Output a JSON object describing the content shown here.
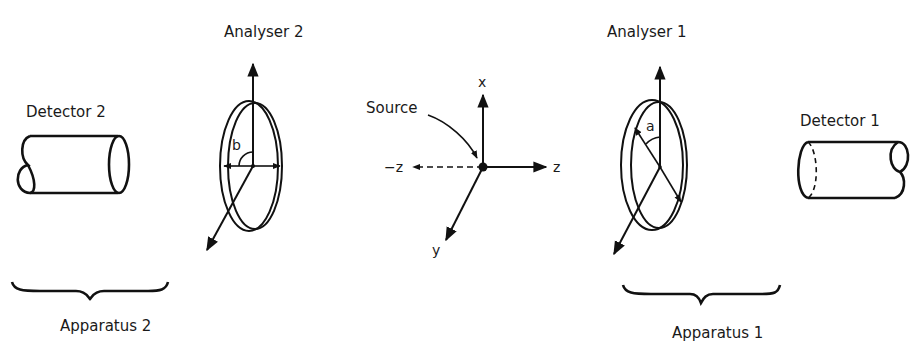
{
  "diagram": {
    "type": "EPR polarization correlation experiment schematic",
    "labels": {
      "analyser2": "Analyser 2",
      "analyser1": "Analyser 1",
      "detector2": "Detector 2",
      "detector1": "Detector 1",
      "source": "Source",
      "axis_x": "x",
      "axis_y": "y",
      "axis_z": "z",
      "axis_neg_z": "−z",
      "angle_b": "b",
      "angle_a": "a",
      "apparatus2": "Apparatus 2",
      "apparatus1": "Apparatus 1"
    },
    "groups": [
      {
        "name": "Apparatus 2",
        "contains": [
          "Detector 2",
          "Analyser 2"
        ],
        "angle": "b",
        "side": "left"
      },
      {
        "name": "Apparatus 1",
        "contains": [
          "Analyser 1",
          "Detector 1"
        ],
        "angle": "a",
        "side": "right"
      }
    ],
    "coordinate_axes": [
      "x",
      "y",
      "z",
      "−z"
    ],
    "colors": {
      "ink": "#111111",
      "background": "#ffffff"
    }
  }
}
